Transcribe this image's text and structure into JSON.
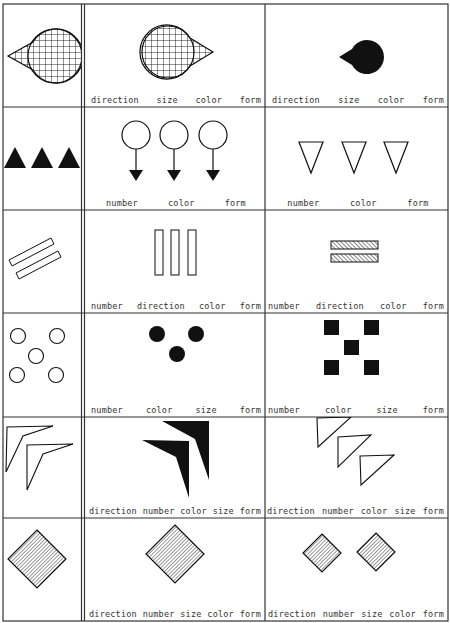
{
  "figure": {
    "columns": [
      "reference",
      "variant_1",
      "variant_2"
    ],
    "rows": [
      {
        "reference": {
          "shape": "teardrop-arrow",
          "count": 1,
          "fill": "crosshatch",
          "direction": "left"
        },
        "variant_1": {
          "shape": "teardrop-arrow",
          "count": 1,
          "fill": "crosshatch",
          "direction": "right",
          "labels": [
            "direction",
            "size",
            "color",
            "form"
          ]
        },
        "variant_2": {
          "shape": "teardrop-arrow",
          "count": 1,
          "fill": "solid-black",
          "direction": "left",
          "size": "small",
          "labels": [
            "direction",
            "size",
            "color",
            "form"
          ]
        }
      },
      {
        "reference": {
          "shape": "triangle-up",
          "count": 3,
          "fill": "solid-black"
        },
        "variant_1": {
          "shape": "lollipop-arrow-down",
          "count": 3,
          "fill": "outline",
          "labels": [
            "number",
            "color",
            "form"
          ]
        },
        "variant_2": {
          "shape": "triangle-down",
          "count": 3,
          "fill": "outline",
          "labels": [
            "number",
            "color",
            "form"
          ]
        }
      },
      {
        "reference": {
          "shape": "bar-diagonal",
          "count": 2,
          "fill": "outline"
        },
        "variant_1": {
          "shape": "bar-vertical",
          "count": 3,
          "fill": "outline",
          "labels": [
            "number",
            "direction",
            "color",
            "form"
          ]
        },
        "variant_2": {
          "shape": "bar-horizontal",
          "count": 2,
          "fill": "diagonal-hatch",
          "labels": [
            "number",
            "direction",
            "color",
            "form"
          ]
        }
      },
      {
        "reference": {
          "shape": "circle",
          "count": 5,
          "fill": "outline"
        },
        "variant_1": {
          "shape": "circle",
          "count": 3,
          "fill": "solid-black",
          "labels": [
            "number",
            "color",
            "size",
            "form"
          ]
        },
        "variant_2": {
          "shape": "square",
          "count": 5,
          "fill": "solid-black",
          "labels": [
            "number",
            "color",
            "size",
            "form"
          ]
        }
      },
      {
        "reference": {
          "shape": "chevron",
          "count": 2,
          "fill": "outline"
        },
        "variant_1": {
          "shape": "chevron",
          "count": 2,
          "fill": "solid-black",
          "labels": [
            "direction",
            "number",
            "color",
            "size",
            "form"
          ]
        },
        "variant_2": {
          "shape": "right-triangle",
          "count": 3,
          "fill": "outline",
          "labels": [
            "direction",
            "number",
            "color",
            "size",
            "form"
          ]
        }
      },
      {
        "reference": {
          "shape": "diamond",
          "count": 1,
          "fill": "line-hatch"
        },
        "variant_1": {
          "shape": "diamond",
          "count": 1,
          "fill": "line-hatch",
          "labels": [
            "direction",
            "number",
            "size",
            "color",
            "form"
          ]
        },
        "variant_2": {
          "shape": "diamond",
          "count": 2,
          "fill": "line-hatch",
          "size": "small",
          "labels": [
            "direction",
            "number",
            "size",
            "color",
            "form"
          ]
        }
      }
    ]
  },
  "colors": {
    "ink": "#111111",
    "paper": "#ffffff",
    "grid": "#333333"
  }
}
